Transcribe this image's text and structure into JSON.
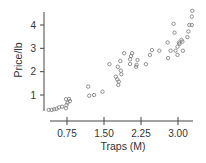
{
  "chart_data": {
    "type": "scatter",
    "title": "",
    "xlabel": "Traps (M)",
    "ylabel": "Price/lb",
    "xlim": [
      0.33,
      3.35
    ],
    "ylim": [
      0.3,
      4.65
    ],
    "xticks": [
      0.75,
      1.5,
      2.25,
      3.0
    ],
    "xtick_labels": [
      "0.75",
      "1.50",
      "2.25",
      "3.00"
    ],
    "yticks": [
      1,
      2,
      3,
      4
    ],
    "ytick_labels": [
      "1",
      "2",
      "3",
      "4"
    ],
    "grid": false,
    "legend": null,
    "marker": "open-circle",
    "marker_color": "#777777",
    "points": [
      [
        0.38,
        0.36
      ],
      [
        0.44,
        0.36
      ],
      [
        0.49,
        0.39
      ],
      [
        0.54,
        0.41
      ],
      [
        0.59,
        0.47
      ],
      [
        0.65,
        0.5
      ],
      [
        0.73,
        0.43
      ],
      [
        0.74,
        0.57
      ],
      [
        0.76,
        0.67
      ],
      [
        0.73,
        0.82
      ],
      [
        0.79,
        0.83
      ],
      [
        0.81,
        0.74
      ],
      [
        1.18,
        1.36
      ],
      [
        1.2,
        0.97
      ],
      [
        1.3,
        1.0
      ],
      [
        1.47,
        1.14
      ],
      [
        1.61,
        2.32
      ],
      [
        1.74,
        1.79
      ],
      [
        1.77,
        1.67
      ],
      [
        1.79,
        1.43
      ],
      [
        1.8,
        1.57
      ],
      [
        1.78,
        2.21
      ],
      [
        1.83,
        2.46
      ],
      [
        1.84,
        2.04
      ],
      [
        1.85,
        1.89
      ],
      [
        1.91,
        2.79
      ],
      [
        2.03,
        2.33
      ],
      [
        2.03,
        2.53
      ],
      [
        2.05,
        2.67
      ],
      [
        2.07,
        2.79
      ],
      [
        2.15,
        2.21
      ],
      [
        2.16,
        2.29
      ],
      [
        2.18,
        2.5
      ],
      [
        2.35,
        2.32
      ],
      [
        2.43,
        2.72
      ],
      [
        2.47,
        2.93
      ],
      [
        2.62,
        2.9
      ],
      [
        2.79,
        3.25
      ],
      [
        2.8,
        2.58
      ],
      [
        2.85,
        2.9
      ],
      [
        2.91,
        4.05
      ],
      [
        2.93,
        3.67
      ],
      [
        2.95,
        2.9
      ],
      [
        2.99,
        2.72
      ],
      [
        2.99,
        3.07
      ],
      [
        3.02,
        3.25
      ],
      [
        3.03,
        3.19
      ],
      [
        3.07,
        3.36
      ],
      [
        3.09,
        3.29
      ],
      [
        3.1,
        2.9
      ],
      [
        3.19,
        3.48
      ],
      [
        3.21,
        3.72
      ],
      [
        3.23,
        4.0
      ],
      [
        3.28,
        4.0
      ],
      [
        3.28,
        4.36
      ],
      [
        3.29,
        4.61
      ]
    ]
  },
  "axes": {
    "x_title": "Traps (M)",
    "y_title": "Price/lb"
  }
}
